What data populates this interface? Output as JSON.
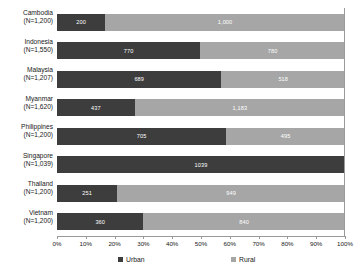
{
  "chart_data": {
    "type": "bar",
    "orientation": "horizontal",
    "stacked": true,
    "normalized_percent": true,
    "title": "",
    "subtitle": "",
    "xlabel": "",
    "ylabel": "",
    "xlim": [
      0,
      100
    ],
    "grid": false,
    "legend_position": "bottom",
    "categories": [
      "Cambodia\n(N=1,200)",
      "Indonesia\n(N=1,550)",
      "Malaysia\n(N=1,207)",
      "Myanmar\n(N=1,620)",
      "Philippines\n(N=1,200)",
      "Singapore\n(N=1,039)",
      "Thailand\n(N=1,200)",
      "Vietnam\n(N=1,200)"
    ],
    "category_names": [
      "Cambodia",
      "Indonesia",
      "Malaysia",
      "Myanmar",
      "Philippines",
      "Singapore",
      "Thailand",
      "Vietnam"
    ],
    "category_sample_sizes": [
      "(N=1,200)",
      "(N=1,550)",
      "(N=1,207)",
      "(N=1,620)",
      "(N=1,200)",
      "(N=1,039)",
      "(N=1,200)",
      "(N=1,200)"
    ],
    "series": [
      {
        "name": "Urban",
        "color": "#3d3d3d",
        "values": [
          200,
          770,
          689,
          437,
          705,
          1039,
          251,
          360
        ],
        "labels": [
          "200",
          "770",
          "689",
          "437",
          "705",
          "1039",
          "251",
          "360"
        ],
        "percents": [
          16.7,
          49.7,
          57.1,
          27.0,
          58.8,
          100.0,
          20.9,
          30.0
        ]
      },
      {
        "name": "Rural",
        "color": "#a6a6a6",
        "values": [
          1000,
          780,
          518,
          1183,
          495,
          0,
          949,
          840
        ],
        "labels": [
          "1,000",
          "780",
          "518",
          "1,183",
          "495",
          "",
          "949",
          "840"
        ],
        "percents": [
          83.3,
          50.3,
          42.9,
          73.0,
          41.2,
          0.0,
          79.1,
          70.0
        ]
      }
    ],
    "xticks": [
      0,
      10,
      20,
      30,
      40,
      50,
      60,
      70,
      80,
      90,
      100
    ],
    "xtick_labels": [
      "0%",
      "10%",
      "20%",
      "30%",
      "40%",
      "50%",
      "60%",
      "70%",
      "80%",
      "90%",
      "100%"
    ]
  },
  "legend": {
    "items": [
      {
        "label": "Urban",
        "color": "#3d3d3d"
      },
      {
        "label": "Rural",
        "color": "#a6a6a6"
      }
    ]
  }
}
